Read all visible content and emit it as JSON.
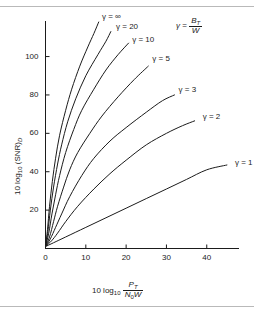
{
  "chart_data": {
    "type": "line",
    "title": "",
    "xlabel": "10 log10 PT/(N0 W)",
    "ylabel": "10 log10 (SNR)D",
    "xlim": [
      0,
      48
    ],
    "ylim": [
      0,
      118
    ],
    "xticks": [
      "0",
      "10",
      "20",
      "30",
      "40"
    ],
    "xtick_values": [
      0,
      10,
      20,
      30,
      40
    ],
    "yticks": [
      "20",
      "40",
      "60",
      "80",
      "100"
    ],
    "ytick_values": [
      20,
      40,
      60,
      80,
      100
    ],
    "grid": false,
    "legend": "inline curve labels",
    "annotation": "gamma = BT / W",
    "series": [
      {
        "name": "gamma = 1",
        "label": "γ = 1",
        "label_x": 46.5,
        "label_y": 45,
        "points": [
          [
            0,
            1
          ],
          [
            2,
            3
          ],
          [
            5,
            6
          ],
          [
            10,
            11
          ],
          [
            15,
            16
          ],
          [
            20,
            21
          ],
          [
            25,
            26
          ],
          [
            30,
            31
          ],
          [
            35,
            36
          ],
          [
            40,
            41
          ],
          [
            45,
            43.5
          ]
        ]
      },
      {
        "name": "gamma = 2",
        "label": "γ = 2",
        "label_x": 38.5,
        "label_y": 69,
        "points": [
          [
            0,
            1
          ],
          [
            1.5,
            4
          ],
          [
            3,
            8
          ],
          [
            5,
            14
          ],
          [
            8,
            22
          ],
          [
            12,
            31
          ],
          [
            16,
            39
          ],
          [
            20,
            46
          ],
          [
            25,
            54
          ],
          [
            30,
            60
          ],
          [
            34,
            64
          ],
          [
            37,
            66.5
          ]
        ]
      },
      {
        "name": "gamma = 3",
        "label": "γ = 3",
        "label_x": 32.5,
        "label_y": 83,
        "points": [
          [
            0,
            1
          ],
          [
            1.2,
            5
          ],
          [
            2.5,
            11
          ],
          [
            4,
            18
          ],
          [
            6,
            27
          ],
          [
            9,
            38
          ],
          [
            12,
            47
          ],
          [
            16,
            56
          ],
          [
            20,
            63
          ],
          [
            25,
            71
          ],
          [
            29,
            77
          ],
          [
            32,
            80
          ]
        ]
      },
      {
        "name": "gamma = 5",
        "label": "γ = 5",
        "label_x": 26,
        "label_y": 99,
        "points": [
          [
            0,
            1
          ],
          [
            1,
            6
          ],
          [
            2,
            14
          ],
          [
            3,
            22
          ],
          [
            4.5,
            32
          ],
          [
            6,
            41
          ],
          [
            8,
            50
          ],
          [
            11,
            60
          ],
          [
            14,
            69
          ],
          [
            18,
            79
          ],
          [
            22,
            88
          ],
          [
            25.5,
            95
          ]
        ]
      },
      {
        "name": "gamma = 10",
        "label": "γ = 10",
        "label_x": 21,
        "label_y": 109,
        "points": [
          [
            0,
            1
          ],
          [
            0.8,
            8
          ],
          [
            1.6,
            18
          ],
          [
            2.5,
            28
          ],
          [
            3.5,
            38
          ],
          [
            5,
            50
          ],
          [
            7,
            62
          ],
          [
            9,
            72
          ],
          [
            12,
            83
          ],
          [
            15,
            93
          ],
          [
            18,
            101
          ],
          [
            20.6,
            107
          ]
        ]
      },
      {
        "name": "gamma = 20",
        "label": "γ = 20",
        "label_x": 17,
        "label_y": 116,
        "points": [
          [
            0,
            1
          ],
          [
            0.6,
            9
          ],
          [
            1.2,
            20
          ],
          [
            2,
            32
          ],
          [
            3,
            44
          ],
          [
            4,
            54
          ],
          [
            5.5,
            66
          ],
          [
            7.5,
            78
          ],
          [
            10,
            90
          ],
          [
            13,
            101
          ],
          [
            15,
            108
          ],
          [
            16.2,
            113
          ]
        ]
      },
      {
        "name": "gamma = infinity",
        "label": "γ = ∞",
        "label_x": 13.5,
        "label_y": 121,
        "points": [
          [
            0,
            1
          ],
          [
            0.5,
            10
          ],
          [
            1,
            22
          ],
          [
            1.7,
            35
          ],
          [
            2.5,
            47
          ],
          [
            3.5,
            59
          ],
          [
            5,
            72
          ],
          [
            6.5,
            83
          ],
          [
            8.5,
            95
          ],
          [
            10.5,
            105
          ],
          [
            12,
            112
          ],
          [
            13.2,
            118
          ]
        ]
      }
    ]
  },
  "axis": {
    "x_title_prefix": "10 log",
    "x_title_sub": "10",
    "x_frac_num": "P",
    "x_frac_num_sub": "T",
    "x_frac_den_a": "N",
    "x_frac_den_sub": "0",
    "x_frac_den_b": "W",
    "y_title_prefix": "10 log",
    "y_title_sub": "10",
    "y_title_body": "(SNR)",
    "y_title_body_sub": "D"
  },
  "gamma_definition": {
    "symbol": "γ",
    "equals": "=",
    "numerator": "B",
    "numerator_sub": "T",
    "denominator": "W"
  }
}
